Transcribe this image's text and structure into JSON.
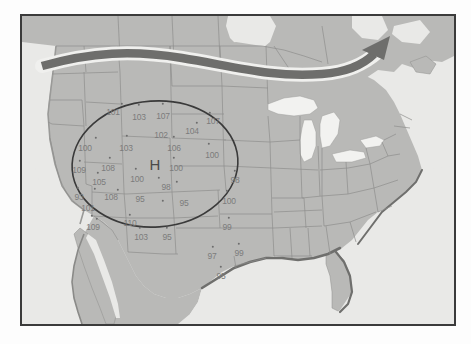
{
  "figure": {
    "kind": "weather-map",
    "region": "North America",
    "frame_border_color": "#3b3b3b",
    "background_color": "#fdfdfd",
    "ocean_color": "#e9e9e7",
    "land_color": "#b9b9b7",
    "lake_color": "#f2f2f0",
    "border_line_color": "#8e8e8c",
    "coast_shadow_color": "#6f6f6d"
  },
  "jet_stream": {
    "name": "jet-stream-arrow",
    "color": "#6e6e6c",
    "halo_color": "#f0f0ee",
    "direction": "west-to-east, curving northeast",
    "arrowhead": "right"
  },
  "pressure_center": {
    "label": "H",
    "type": "high",
    "color": "#4a4a4a"
  },
  "isobar": {
    "name": "closed-contour-oval",
    "color": "#3a3a3a",
    "encloses": "high-pressure-center"
  },
  "chart_data": {
    "type": "scatter",
    "title": "",
    "xlabel": "",
    "ylabel": "",
    "units": "degrees Fahrenheit",
    "stations": [
      {
        "value": "101",
        "x": 91,
        "y": 96,
        "dot_x": 100,
        "dot_y": 88
      },
      {
        "value": "103",
        "x": 117,
        "y": 101,
        "dot_x": 117,
        "dot_y": 89
      },
      {
        "value": "107",
        "x": 141,
        "y": 100,
        "dot_x": 141,
        "dot_y": 88
      },
      {
        "value": "107",
        "x": 191,
        "y": 105,
        "dot_x": 188,
        "dot_y": 97
      },
      {
        "value": "104",
        "x": 170,
        "y": 115,
        "dot_x": 175,
        "dot_y": 107
      },
      {
        "value": "102",
        "x": 139,
        "y": 119,
        "dot_x": 152,
        "dot_y": 121
      },
      {
        "value": "100",
        "x": 63,
        "y": 132,
        "dot_x": 74,
        "dot_y": 122
      },
      {
        "value": "103",
        "x": 104,
        "y": 132,
        "dot_x": 105,
        "dot_y": 120
      },
      {
        "value": "106",
        "x": 152,
        "y": 132,
        "dot_x": 152,
        "dot_y": 142
      },
      {
        "value": "100",
        "x": 190,
        "y": 139,
        "dot_x": 187,
        "dot_y": 128
      },
      {
        "value": "109",
        "x": 57,
        "y": 154,
        "dot_x": 58,
        "dot_y": 145
      },
      {
        "value": "108",
        "x": 86,
        "y": 152,
        "dot_x": 88,
        "dot_y": 142
      },
      {
        "value": "105",
        "x": 77,
        "y": 166,
        "dot_x": 76,
        "dot_y": 157
      },
      {
        "value": "100",
        "x": 115,
        "y": 163,
        "dot_x": 114,
        "dot_y": 153
      },
      {
        "value": "100",
        "x": 154,
        "y": 152,
        "dot_x": 155,
        "dot_y": 166
      },
      {
        "value": "98",
        "x": 144,
        "y": 171,
        "dot_x": 137,
        "dot_y": 162
      },
      {
        "value": "98",
        "x": 213,
        "y": 164,
        "dot_x": 213,
        "dot_y": 155
      },
      {
        "value": "93",
        "x": 57,
        "y": 181,
        "dot_x": 56,
        "dot_y": 172
      },
      {
        "value": "108",
        "x": 89,
        "y": 181,
        "dot_x": 73,
        "dot_y": 173
      },
      {
        "value": "95",
        "x": 118,
        "y": 183,
        "dot_x": 96,
        "dot_y": 174
      },
      {
        "value": "95",
        "x": 162,
        "y": 187,
        "dot_x": 141,
        "dot_y": 185
      },
      {
        "value": "100",
        "x": 207,
        "y": 185,
        "dot_x": 205,
        "dot_y": 175
      },
      {
        "value": "101",
        "x": 66,
        "y": 192,
        "dot_x": 70,
        "dot_y": 200
      },
      {
        "value": "110",
        "x": 108,
        "y": 207,
        "dot_x": 108,
        "dot_y": 199
      },
      {
        "value": "99",
        "x": 205,
        "y": 211,
        "dot_x": 207,
        "dot_y": 202
      },
      {
        "value": "109",
        "x": 71,
        "y": 211,
        "dot_x": 75,
        "dot_y": 203
      },
      {
        "value": "103",
        "x": 119,
        "y": 221,
        "dot_x": 118,
        "dot_y": 212
      },
      {
        "value": "95",
        "x": 145,
        "y": 221,
        "dot_x": 145,
        "dot_y": 212
      },
      {
        "value": "97",
        "x": 190,
        "y": 240,
        "dot_x": 191,
        "dot_y": 231
      },
      {
        "value": "99",
        "x": 217,
        "y": 237,
        "dot_x": 217,
        "dot_y": 228
      },
      {
        "value": "95",
        "x": 199,
        "y": 260,
        "dot_x": 199,
        "dot_y": 251
      }
    ]
  }
}
